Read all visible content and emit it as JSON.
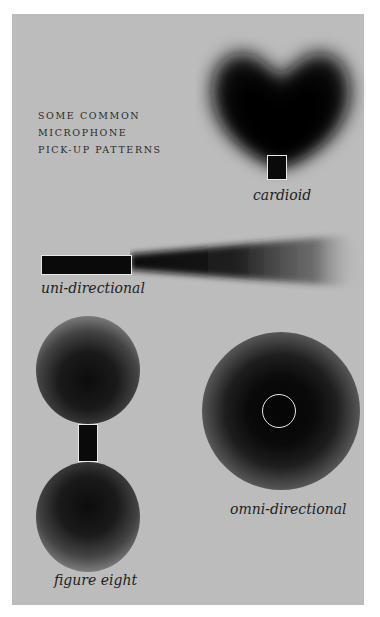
{
  "title": {
    "lines": [
      "SOME COMMON",
      "MICROPHONE",
      "PICK-UP PATTERNS"
    ]
  },
  "patterns": [
    {
      "id": "cardioid",
      "label": "cardioid"
    },
    {
      "id": "uni-directional",
      "label": "uni-directional"
    },
    {
      "id": "figure-eight",
      "label": "figure eight"
    },
    {
      "id": "omni-directional",
      "label": "omni-directional"
    }
  ],
  "colors": {
    "background": "#bcbcbc",
    "pattern_dark": "#0a0a0a",
    "mic_outline": "#e8e8e8"
  }
}
